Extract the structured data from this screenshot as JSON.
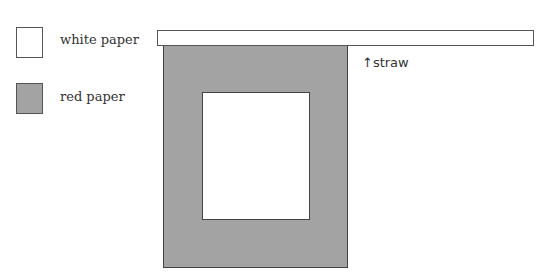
{
  "legend": {
    "items": [
      {
        "label": "white paper",
        "color": "#ffffff"
      },
      {
        "label": "red paper",
        "color": "#a3a3a3"
      }
    ]
  },
  "diagram": {
    "straw_label": "↑straw"
  }
}
